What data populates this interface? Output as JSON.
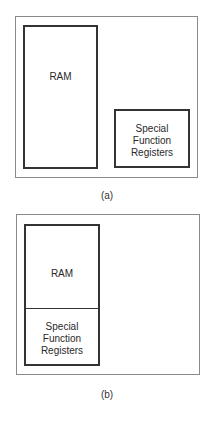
{
  "figure_a": {
    "caption": "(a)",
    "ram_label": "RAM",
    "sfr_label_lines": [
      "Special",
      "Function",
      "Registers"
    ]
  },
  "figure_b": {
    "caption": "(b)",
    "ram_label": "RAM",
    "sfr_label_lines": [
      "Special",
      "Function",
      "Registers"
    ]
  }
}
